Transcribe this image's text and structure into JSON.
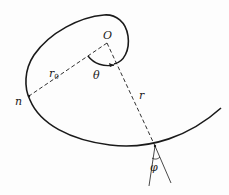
{
  "diagram": {
    "type": "spiral-geometry",
    "labels": {
      "origin": "O",
      "initial_radius": "r",
      "initial_radius_sub": "0",
      "point_n": "n",
      "angle_theta": "θ",
      "radius": "r",
      "angle_phi": "φ"
    },
    "colors": {
      "stroke": "#1a1a1a",
      "background": "#fdfdfd"
    }
  }
}
